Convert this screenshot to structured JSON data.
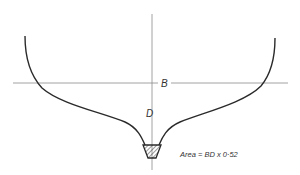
{
  "diagram": {
    "type": "ship midship cross-section",
    "labels": {
      "breadth": "B",
      "depth": "D",
      "area_formula": "Area = BD x 0·52"
    },
    "colors": {
      "hull_line": "#2a2a2a",
      "axis_line": "#8a8a8a",
      "text": "#333333",
      "background": "#ffffff"
    },
    "geometry": {
      "centerline_x": 152,
      "waterline_y": 83,
      "keel_hatched": true
    }
  }
}
